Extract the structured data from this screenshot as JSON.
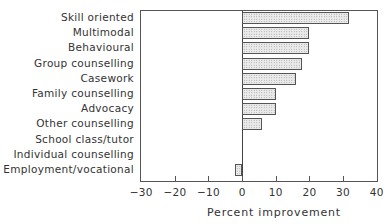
{
  "chart_data": {
    "type": "bar",
    "orientation": "horizontal",
    "title": "",
    "xlabel": "Percent improvement",
    "ylabel": "",
    "xlim": [
      -30,
      40
    ],
    "x_ticks": [
      -30,
      -20,
      -10,
      0,
      10,
      20,
      30,
      40
    ],
    "grid": false,
    "legend": null,
    "categories": [
      "Skill oriented",
      "Multimodal",
      "Behavioural",
      "Group counselling",
      "Casework",
      "Family counselling",
      "Advocacy",
      "Other counselling",
      "School class/tutor",
      "Individual counselling",
      "Employment/vocational"
    ],
    "values": [
      32,
      20,
      20,
      18,
      16,
      10,
      10,
      6,
      0,
      0,
      -2
    ]
  },
  "labels": {
    "xlabel": "Percent improvement",
    "ticks": [
      "−30",
      "−20",
      "−10",
      "0",
      "10",
      "20",
      "30",
      "40"
    ]
  }
}
